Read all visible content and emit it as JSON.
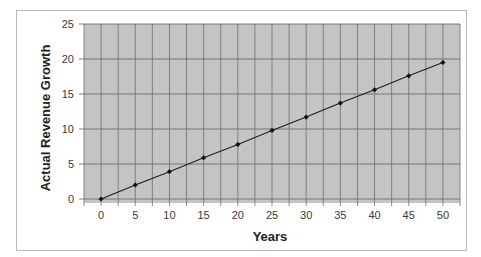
{
  "chart_data": {
    "type": "line",
    "title": "",
    "xlabel": "Years",
    "ylabel": "Actual Revenue Growth",
    "x": [
      0,
      5,
      10,
      15,
      20,
      25,
      30,
      35,
      40,
      45,
      50
    ],
    "series": [
      {
        "name": "Actual Revenue Growth",
        "values": [
          0,
          2.0,
          3.9,
          5.9,
          7.8,
          9.8,
          11.7,
          13.7,
          15.6,
          17.6,
          19.5
        ]
      }
    ],
    "xticks": [
      "0",
      "5",
      "10",
      "15",
      "20",
      "25",
      "30",
      "35",
      "40",
      "45",
      "50"
    ],
    "yticks": [
      "0",
      "5",
      "10",
      "15",
      "20",
      "25"
    ],
    "ylim": [
      0,
      25
    ],
    "xlim": [
      -2.5,
      52.5
    ],
    "grid": true,
    "legend": "none",
    "colors": {
      "plot_bg": "#c4c4c4",
      "grid": "#6e6e6e",
      "line": "#1e1e1e",
      "marker": "#111111"
    }
  }
}
